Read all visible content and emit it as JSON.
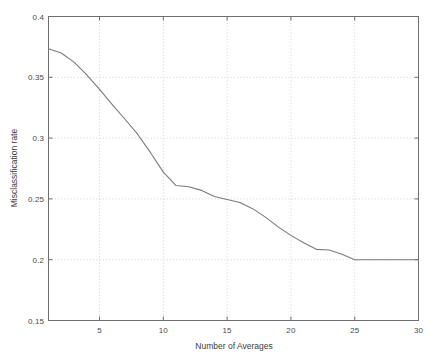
{
  "chart_data": {
    "type": "line",
    "title": "",
    "xlabel": "Number of Averages",
    "ylabel": "Misclassification rate",
    "xlim": [
      1,
      30
    ],
    "ylim": [
      0.15,
      0.4
    ],
    "xticks": [
      5,
      10,
      15,
      20,
      25,
      30
    ],
    "yticks": [
      0.15,
      0.2,
      0.25,
      0.3,
      0.35,
      0.4
    ],
    "xtick_labels": [
      "5",
      "10",
      "15",
      "20",
      "25",
      "30"
    ],
    "ytick_labels": [
      "0.15",
      "0.2",
      "0.25",
      "0.3",
      "0.35",
      "0.4"
    ],
    "grid": true,
    "grid_style": "dotted",
    "legend": null,
    "line_color": "#7a7a7a",
    "axis_color": "#6e6e6e",
    "grid_color": "#c8c8c8",
    "background": "#ffffff",
    "series": [
      {
        "name": "Misclassification rate",
        "x": [
          1,
          2,
          3,
          4,
          5,
          6,
          7,
          8,
          9,
          10,
          11,
          12,
          13,
          14,
          15,
          16,
          17,
          18,
          19,
          20,
          21,
          22,
          23,
          24,
          25,
          26,
          27,
          28,
          29,
          30
        ],
        "values": [
          0.3735,
          0.37,
          0.3625,
          0.352,
          0.34,
          0.3275,
          0.3155,
          0.303,
          0.288,
          0.272,
          0.261,
          0.26,
          0.257,
          0.252,
          0.2495,
          0.247,
          0.242,
          0.235,
          0.227,
          0.22,
          0.214,
          0.2085,
          0.208,
          0.2045,
          0.2,
          0.2,
          0.2,
          0.2,
          0.2,
          0.2
        ]
      }
    ]
  },
  "axes": {
    "x_title": "Number of Averages",
    "y_title": "Misclassification rate"
  }
}
